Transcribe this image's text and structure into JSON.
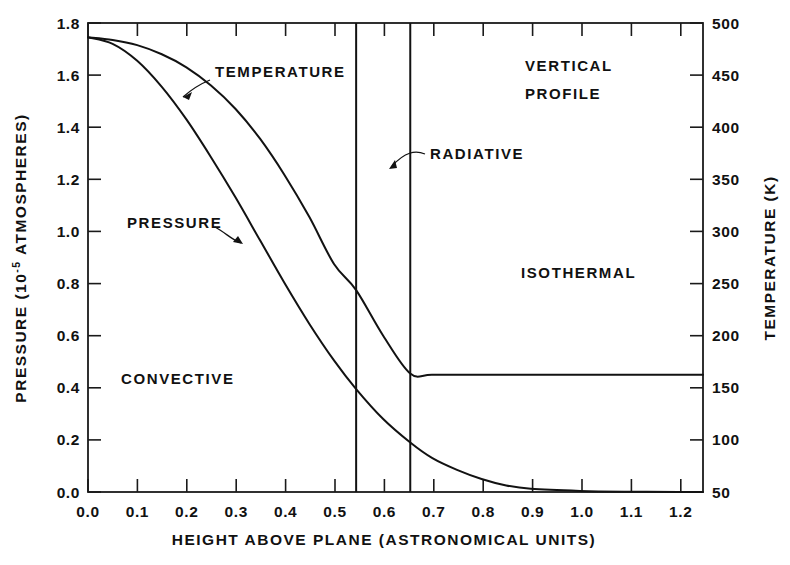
{
  "chart_data": {
    "type": "line",
    "title": "",
    "annotation_title": "VERTICAL PROFILE",
    "xlabel": "HEIGHT ABOVE PLANE (ASTRONOMICAL UNITS)",
    "ylabel_left": "PRESSURE (10",
    "ylabel_left_exp": "-5",
    "ylabel_left_tail": " ATMOSPHERES)",
    "ylabel_left_full": "PRESSURE (10^-5 ATMOSPHERES)",
    "ylabel_right": "TEMPERATURE (K)",
    "xlim": [
      0.0,
      1.25
    ],
    "ylim_left": [
      0.0,
      1.8
    ],
    "ylim_right": [
      50,
      500
    ],
    "grid": false,
    "legend": "none",
    "xticks": [
      0.0,
      0.1,
      0.2,
      0.3,
      0.4,
      0.5,
      0.6,
      0.7,
      0.8,
      0.9,
      1.0,
      1.1,
      1.2
    ],
    "xticklabels": [
      "0.0",
      "0.1",
      "0.2",
      "0.3",
      "0.4",
      "0.5",
      "0.6",
      "0.7",
      "0.8",
      "0.9",
      "1.0",
      "1.1",
      "1.2"
    ],
    "yticks_left": [
      0.0,
      0.2,
      0.4,
      0.6,
      0.8,
      1.0,
      1.2,
      1.4,
      1.6,
      1.8
    ],
    "yticklabels_left": [
      "0.0",
      "0.2",
      "0.4",
      "0.6",
      "0.8",
      "1.0",
      "1.2",
      "1.4",
      "1.6",
      "1.8"
    ],
    "yticks_right": [
      50,
      100,
      150,
      200,
      250,
      300,
      350,
      400,
      450,
      500
    ],
    "yticklabels_right": [
      "50",
      "100",
      "150",
      "200",
      "250",
      "300",
      "350",
      "400",
      "450",
      "500"
    ],
    "series": [
      {
        "name": "TEMPERATURE",
        "axis": "right",
        "x": [
          0.0,
          0.05,
          0.1,
          0.15,
          0.2,
          0.25,
          0.3,
          0.35,
          0.4,
          0.45,
          0.5,
          0.545,
          0.6,
          0.655,
          0.7,
          0.8,
          0.9,
          1.0,
          1.1,
          1.2,
          1.25
        ],
        "y_left_scale": [
          1.745,
          1.735,
          1.715,
          1.68,
          1.63,
          1.56,
          1.47,
          1.355,
          1.215,
          1.055,
          0.875,
          0.775,
          0.6,
          0.455,
          0.45,
          0.45,
          0.45,
          0.45,
          0.45,
          0.45,
          0.45
        ],
        "y_kelvin": [
          485,
          483,
          478,
          470,
          458,
          441,
          419,
          391,
          356,
          316,
          271,
          247,
          203,
          167,
          165,
          165,
          165,
          165,
          165,
          165,
          165
        ]
      },
      {
        "name": "PRESSURE",
        "axis": "left",
        "x": [
          0.0,
          0.05,
          0.1,
          0.15,
          0.2,
          0.25,
          0.3,
          0.35,
          0.4,
          0.45,
          0.5,
          0.545,
          0.6,
          0.655,
          0.7,
          0.75,
          0.8,
          0.85,
          0.9,
          1.0,
          1.1,
          1.2,
          1.25
        ],
        "y_atm": [
          1.745,
          1.72,
          1.655,
          1.555,
          1.43,
          1.285,
          1.13,
          0.965,
          0.8,
          0.645,
          0.505,
          0.395,
          0.28,
          0.19,
          0.13,
          0.085,
          0.05,
          0.025,
          0.012,
          0.004,
          0.001,
          0.0,
          0.0
        ]
      }
    ],
    "vertical_boundaries": [
      {
        "name": "convective-radiative-boundary",
        "x": 0.545
      },
      {
        "name": "radiative-isothermal-boundary",
        "x": 0.655
      }
    ],
    "region_labels": [
      {
        "name": "CONVECTIVE",
        "x": 0.22,
        "y_left": 0.45
      },
      {
        "name": "ISOTHERMAL",
        "x": 0.81,
        "y_left": 0.93
      }
    ],
    "curve_labels": [
      {
        "name": "TEMPERATURE",
        "x": 0.4,
        "y_left": 1.58
      },
      {
        "name": "PRESSURE",
        "x": 0.155,
        "y_left": 1.02
      },
      {
        "name": "RADIATIVE",
        "x": 0.6,
        "y_left": 1.27
      }
    ],
    "colors": {
      "line": "#121212",
      "axis": "#1a1a1a",
      "text": "#111111",
      "background": "#ffffff"
    }
  }
}
